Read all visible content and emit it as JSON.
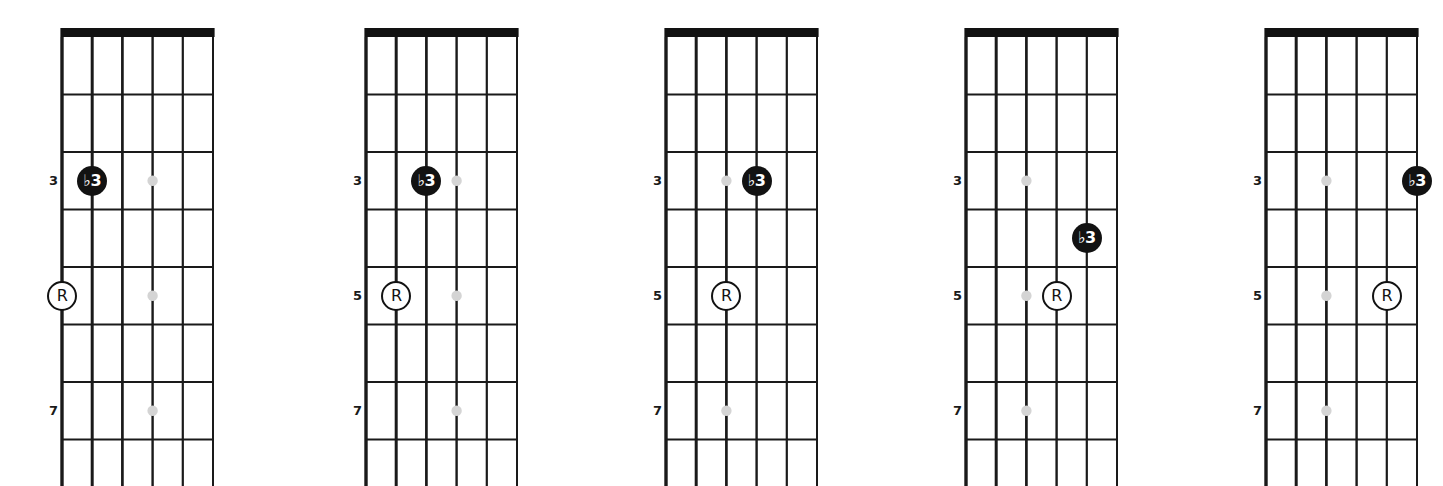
{
  "figure": {
    "kind": "guitar-fretboard-diagrams",
    "diagram_count": 5,
    "strings": 6,
    "fret_spaces": 8,
    "colors": {
      "line": "#1a1a1a",
      "nut": "#121212",
      "inlay_dot": "#d4d4d4",
      "marker_filled_bg": "#121212",
      "marker_filled_text": "#ffffff",
      "marker_hollow_bg": "#ffffff",
      "marker_hollow_border": "#121212",
      "marker_hollow_text": "#121212",
      "background": "#ffffff"
    },
    "fret_labels": [
      {
        "text": "3",
        "fret": 3
      },
      {
        "text": "5",
        "fret": 5
      },
      {
        "text": "7",
        "fret": 7
      }
    ],
    "marker_legend": {
      "root": "R",
      "flat_third": "♭3"
    },
    "diagrams": [
      {
        "id": "diagram-1",
        "x": 0,
        "inlay_string": 4,
        "inlay_frets": [
          3,
          5,
          7
        ],
        "markers": [
          {
            "label": "♭3",
            "string": 2,
            "fret": 3,
            "style": "filled"
          },
          {
            "label": "R",
            "string": 1,
            "fret": 5,
            "style": "hollow"
          }
        ]
      },
      {
        "id": "diagram-2",
        "x": 304,
        "inlay_string": 4,
        "inlay_frets": [
          3,
          5,
          7
        ],
        "markers": [
          {
            "label": "♭3",
            "string": 3,
            "fret": 3,
            "style": "filled"
          },
          {
            "label": "R",
            "string": 2,
            "fret": 5,
            "style": "hollow"
          }
        ]
      },
      {
        "id": "diagram-3",
        "x": 604,
        "inlay_string": 3,
        "inlay_frets": [
          3,
          5,
          7
        ],
        "markers": [
          {
            "label": "♭3",
            "string": 4,
            "fret": 3,
            "style": "filled"
          },
          {
            "label": "R",
            "string": 3,
            "fret": 5,
            "style": "hollow"
          }
        ]
      },
      {
        "id": "diagram-4",
        "x": 904,
        "inlay_string": 3,
        "inlay_frets": [
          3,
          5,
          7
        ],
        "markers": [
          {
            "label": "♭3",
            "string": 5,
            "fret": 4,
            "style": "filled"
          },
          {
            "label": "R",
            "string": 4,
            "fret": 5,
            "style": "hollow"
          }
        ]
      },
      {
        "id": "diagram-5",
        "x": 1204,
        "inlay_string": 3,
        "inlay_frets": [
          3,
          5,
          7
        ],
        "markers": [
          {
            "label": "♭3",
            "string": 6,
            "fret": 3,
            "style": "filled"
          },
          {
            "label": "R",
            "string": 5,
            "fret": 5,
            "style": "hollow"
          }
        ]
      }
    ],
    "geometry": {
      "board_left": 62,
      "string_spacing": 30.2,
      "nut_y": 37,
      "fret_spacing": 57.5,
      "nut_thickness": 9
    }
  }
}
